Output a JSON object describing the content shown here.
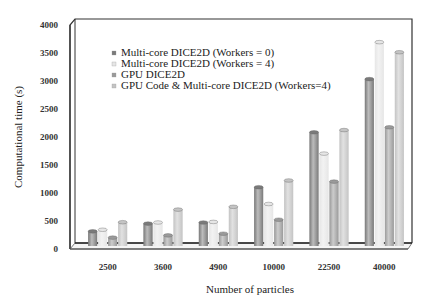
{
  "chart_data": {
    "type": "bar",
    "title": "",
    "xlabel": "Number of particles",
    "ylabel": "Computational time (s)",
    "ylim": [
      0,
      4000
    ],
    "yticks": [
      0,
      500,
      1000,
      1500,
      2000,
      2500,
      3000,
      3500,
      4000
    ],
    "categories": [
      "2500",
      "3600",
      "4900",
      "10000",
      "22500",
      "40000"
    ],
    "grid": false,
    "legend_position": "upper-left-inside",
    "style": "3d-cylinder",
    "series": [
      {
        "name": "Multi-core DICE2D (Workers = 0)",
        "color": "#7a7a7a",
        "values": [
          262,
          400,
          420,
          1050,
          2030,
          2980
        ]
      },
      {
        "name": "Multi-core DICE2D (Workers = 4)",
        "color": "#e6e6e6",
        "values": [
          290,
          420,
          430,
          750,
          1650,
          3640
        ]
      },
      {
        "name": "GPU DICE2D",
        "color": "#9a9a9a",
        "values": [
          150,
          190,
          220,
          470,
          1150,
          2120
        ]
      },
      {
        "name": "GPU Code & Multi-core DICE2D (Workers=4)",
        "color": "#c4c4c4",
        "values": [
          425,
          650,
          700,
          1170,
          2070,
          3460
        ]
      }
    ]
  }
}
